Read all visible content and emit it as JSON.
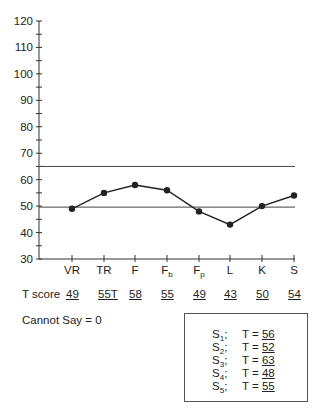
{
  "chart_data": {
    "type": "line",
    "title": "",
    "xlabel": "",
    "ylabel": "",
    "ylim": [
      30,
      120
    ],
    "yticks_major": [
      30,
      40,
      50,
      60,
      70,
      80,
      90,
      100,
      110,
      120
    ],
    "yticks_minor_step": 5,
    "categories": [
      "VR",
      "TR",
      "F",
      "Fb",
      "Fp",
      "L",
      "K",
      "S"
    ],
    "category_labels": [
      {
        "base": "VR",
        "sub": ""
      },
      {
        "base": "TR",
        "sub": ""
      },
      {
        "base": "F",
        "sub": ""
      },
      {
        "base": "F",
        "sub": "b"
      },
      {
        "base": "F",
        "sub": "p"
      },
      {
        "base": "L",
        "sub": ""
      },
      {
        "base": "K",
        "sub": ""
      },
      {
        "base": "S",
        "sub": ""
      }
    ],
    "series": [
      {
        "name": "T score",
        "values": [
          49,
          55,
          58,
          56,
          48,
          43,
          50,
          54
        ],
        "marker": "circle",
        "color": "#222222"
      }
    ],
    "reference_lines": [
      65,
      50
    ],
    "grid": false,
    "legend": null
  },
  "tscore_row": {
    "label": "T score",
    "values": [
      "49",
      "55T",
      "58",
      "55",
      "49",
      "43",
      "50",
      "54"
    ]
  },
  "cannot_say": "Cannot Say = 0",
  "s_box": {
    "rows": [
      {
        "base": "S",
        "sub": "1",
        "sep": ";",
        "eq": "T =",
        "value": "56"
      },
      {
        "base": "S",
        "sub": "2",
        "sep": ";",
        "eq": "T =",
        "value": "52"
      },
      {
        "base": "S",
        "sub": "3",
        "sep": ";",
        "eq": "T =",
        "value": "63"
      },
      {
        "base": "S",
        "sub": "4",
        "sep": ";",
        "eq": "T =",
        "value": "48"
      },
      {
        "base": "S",
        "sub": "5",
        "sep": ";",
        "eq": "T =",
        "value": "55"
      }
    ]
  }
}
